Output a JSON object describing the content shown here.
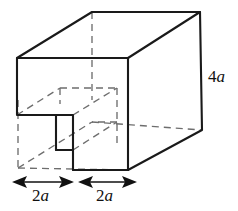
{
  "figure": {
    "background_color": "#ffffff",
    "solid_edge_color": "#1a1a1a",
    "hidden_edge_color": "#6e6e6e",
    "label_color": "#111111"
  },
  "labels": {
    "height": {
      "text": "4a",
      "coefficient": "4",
      "variable": "a",
      "position": "right-side"
    },
    "width_left": {
      "text": "2a",
      "coefficient": "2",
      "variable": "a",
      "position": "bottom-left"
    },
    "width_right": {
      "text": "2a",
      "coefficient": "2",
      "variable": "a",
      "position": "bottom-right"
    }
  },
  "dimensions": [
    {
      "name": "height",
      "value": "4a"
    },
    {
      "name": "notch-width",
      "value": "2a"
    },
    {
      "name": "remaining-width",
      "value": "2a"
    }
  ],
  "geometry": {
    "front_top_left": [
      17,
      58
    ],
    "front_top_right": [
      128,
      58
    ],
    "front_bottom_right": [
      128,
      170
    ],
    "back_top_left": [
      92,
      12
    ],
    "back_top_right": [
      200,
      12
    ],
    "back_bottom_right": [
      202,
      130
    ],
    "back_bottom_left": [
      18,
      168
    ],
    "notch_corner": [
      73,
      115
    ],
    "notch_inner_bottom": [
      73,
      150
    ],
    "notch_left_edge": [
      17,
      115
    ]
  }
}
